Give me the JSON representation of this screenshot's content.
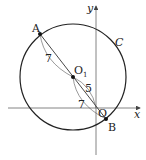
{
  "diagram": {
    "type": "coordinate-geometry",
    "axes": {
      "x_label": "x",
      "y_label": "y",
      "origin_label": "O"
    },
    "circle": {
      "label": "C",
      "center_label": "O",
      "center_subscript": "1"
    },
    "points": {
      "A": "A",
      "B": "B"
    },
    "measurements": {
      "A_to_O1": "7",
      "O1_to_O": "5",
      "O_to_B_region": "7"
    },
    "colors": {
      "stroke": "#222222",
      "axis": "#555555"
    }
  }
}
